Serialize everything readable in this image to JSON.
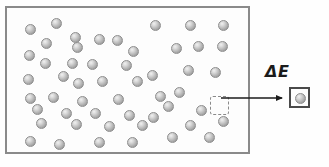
{
  "figure": {
    "type": "physics-schematic",
    "background_color": "#fefefe"
  },
  "system_box": {
    "name": "particle-reservoir",
    "border_color": "#8a8a8a",
    "fill_color": "#fdfdfd",
    "x": 5,
    "y": 6,
    "width": 245,
    "height": 148
  },
  "particles": {
    "fill_color": "#b4b4b4",
    "highlight_color": "#f0f0f0",
    "edge_color": "#8e8e8e",
    "diameter": 11,
    "count": 52,
    "positions": [
      [
        18,
        16
      ],
      [
        44,
        10
      ],
      [
        63,
        24
      ],
      [
        34,
        30
      ],
      [
        87,
        26
      ],
      [
        105,
        27
      ],
      [
        65,
        34
      ],
      [
        143,
        12
      ],
      [
        178,
        12
      ],
      [
        211,
        12
      ],
      [
        17,
        42
      ],
      [
        121,
        38
      ],
      [
        164,
        35
      ],
      [
        186,
        33
      ],
      [
        210,
        33
      ],
      [
        33,
        50
      ],
      [
        60,
        50
      ],
      [
        80,
        51
      ],
      [
        114,
        52
      ],
      [
        16,
        66
      ],
      [
        51,
        63
      ],
      [
        140,
        62
      ],
      [
        176,
        57
      ],
      [
        203,
        59
      ],
      [
        66,
        70
      ],
      [
        90,
        68
      ],
      [
        125,
        68
      ],
      [
        18,
        85
      ],
      [
        41,
        84
      ],
      [
        70,
        88
      ],
      [
        106,
        86
      ],
      [
        148,
        83
      ],
      [
        156,
        93
      ],
      [
        167,
        79
      ],
      [
        25,
        96
      ],
      [
        54,
        100
      ],
      [
        83,
        100
      ],
      [
        117,
        102
      ],
      [
        141,
        104
      ],
      [
        189,
        97
      ],
      [
        29,
        110
      ],
      [
        64,
        111
      ],
      [
        97,
        113
      ],
      [
        130,
        112
      ],
      [
        178,
        112
      ],
      [
        211,
        108
      ],
      [
        18,
        128
      ],
      [
        47,
        131
      ],
      [
        87,
        129
      ],
      [
        120,
        129
      ],
      [
        160,
        124
      ],
      [
        197,
        124
      ]
    ]
  },
  "selection_square": {
    "name": "vacated-site",
    "border_style": "dashed",
    "border_color": "#8a8a8a",
    "x": 203,
    "y": 88,
    "width": 19,
    "height": 19
  },
  "arrow": {
    "name": "energy-transfer-arrow",
    "color": "#1b1b1b",
    "from_x": 221,
    "to_x": 289,
    "y": 98
  },
  "labels": {
    "delta_e": "ΔE"
  },
  "particle_box": {
    "name": "isolated-particle-box",
    "border_color": "#4a4a4a",
    "fill_color": "#fdfdfd",
    "x": 289,
    "y": 87,
    "width": 21,
    "height": 21,
    "particle_count": 1
  }
}
